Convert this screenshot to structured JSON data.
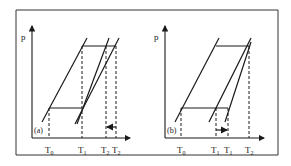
{
  "diagram": {
    "panels": [
      {
        "id": "a",
        "tag": "(a)",
        "y_axis_label": "p",
        "x_ticks": [
          {
            "base": "T",
            "sub": "0"
          },
          {
            "base": "T",
            "sub": "1"
          },
          {
            "base": "T",
            "sub": "2"
          },
          {
            "base": "T",
            "sub": "2"
          }
        ],
        "shift_arrow": "leftward"
      },
      {
        "id": "b",
        "tag": "(b)",
        "y_axis_label": "p",
        "x_ticks": [
          {
            "base": "T",
            "sub": "0"
          },
          {
            "base": "T",
            "sub": "1"
          },
          {
            "base": "T",
            "sub": "1"
          },
          {
            "base": "T",
            "sub": "2"
          }
        ],
        "shift_arrow": "rightward"
      }
    ],
    "colors": {
      "line": "#1a1a1a",
      "background": "#ffffff",
      "frame": "#333333"
    }
  }
}
